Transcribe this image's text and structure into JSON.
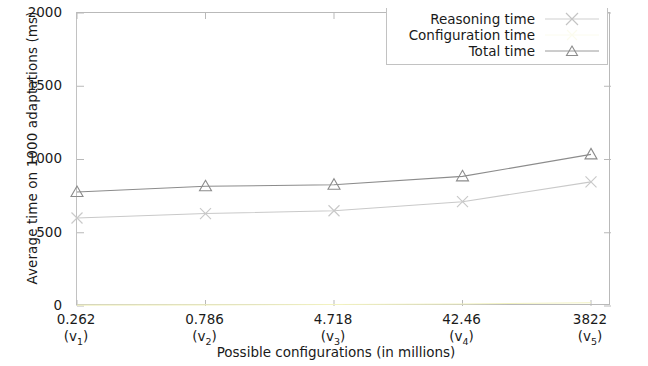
{
  "chart_data": {
    "type": "line",
    "title": "",
    "xlabel": "Possible configurations (in millions)",
    "ylabel": "Average time on 1000 adaptations (ms)",
    "categories": [
      "0.262",
      "0.786",
      "4.718",
      "42.46",
      "3822"
    ],
    "category_sublabels": [
      "(v1)",
      "(v2)",
      "(v3)",
      "(v4)",
      "(v5)"
    ],
    "category_sub_base": [
      "v",
      "v",
      "v",
      "v",
      "v"
    ],
    "category_sub_index": [
      "1",
      "2",
      "3",
      "4",
      "5"
    ],
    "ylim": [
      0,
      2000
    ],
    "yticks": [
      "2000",
      "1500",
      "1000",
      "500",
      "0"
    ],
    "ytick_values": [
      2000,
      1500,
      1000,
      500,
      0
    ],
    "grid": false,
    "legend_position": "top-right",
    "series": [
      {
        "name": "Reasoning time",
        "marker": "x",
        "color": "#c9c9c9",
        "values": [
          601,
          631,
          650,
          712,
          847
        ]
      },
      {
        "name": "Configuration time",
        "marker": "none",
        "color": "#f2f2c0",
        "values": [
          6,
          8,
          10,
          14,
          22
        ]
      },
      {
        "name": "Total time",
        "marker": "triangle",
        "color": "#8c8c8c",
        "values": [
          778,
          817,
          828,
          885,
          1035
        ]
      }
    ]
  },
  "axis": {
    "ytick_labels": [
      "2000",
      "1500",
      "1000",
      "500",
      "0"
    ],
    "xtick_labels": [
      "0.262",
      "0.786",
      "4.718",
      "42.46",
      "3822"
    ],
    "xtick_sublabels": [
      "(v1)",
      "(v2)",
      "(v3)",
      "(v4)",
      "(v5)"
    ],
    "xtitle": "Possible configurations (in millions)",
    "ytitle": "Average time on 1000 adaptations (ms)"
  },
  "legend": {
    "items": [
      {
        "label": "Reasoning time",
        "marker": "x"
      },
      {
        "label": "Configuration time",
        "marker": "none"
      },
      {
        "label": "Total time",
        "marker": "triangle"
      }
    ]
  },
  "colors": {
    "reasoning": "#c9c9c9",
    "configuration": "#f2f2c0",
    "total": "#8c8c8c",
    "frame": "#b9b9b9",
    "text": "#1a1a1a",
    "background": "#ffffff"
  }
}
